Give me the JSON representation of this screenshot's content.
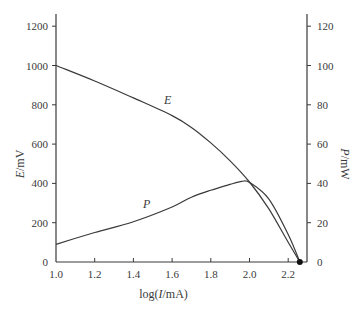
{
  "chart_data": {
    "type": "line",
    "title": "",
    "xlabel": "log(I/mA)",
    "ylabel_left": "E/mV",
    "ylabel_right": "P/mW",
    "xlim": [
      1.0,
      2.3
    ],
    "ylim_left": [
      0,
      1250
    ],
    "ylim_right": [
      0,
      125
    ],
    "x_ticks": [
      "1.0",
      "1.2",
      "1.4",
      "1.6",
      "1.8",
      "2.0",
      "2.2"
    ],
    "y_ticks_left": [
      "0",
      "200",
      "400",
      "600",
      "800",
      "1000",
      "1200"
    ],
    "y_ticks_right": [
      "0",
      "20",
      "40",
      "60",
      "80",
      "100",
      "120"
    ],
    "grid": false,
    "legend": "none (curves labeled inline)",
    "series": [
      {
        "name": "E",
        "axis": "left",
        "x": [
          1.0,
          1.2,
          1.4,
          1.6,
          1.7,
          1.8,
          1.9,
          2.0,
          2.1,
          2.2,
          2.26
        ],
        "values": [
          1000,
          921,
          835,
          745,
          685,
          606,
          515,
          407,
          270,
          100,
          0
        ]
      },
      {
        "name": "P",
        "axis": "right",
        "x": [
          1.0,
          1.2,
          1.4,
          1.6,
          1.7,
          1.8,
          1.9,
          1.96,
          2.0,
          2.1,
          2.2,
          2.26
        ],
        "values": [
          9,
          15,
          20.5,
          28,
          33,
          36.5,
          39.5,
          41,
          40.5,
          32,
          14,
          0
        ]
      }
    ],
    "annotations": [
      {
        "text": "E",
        "x": 1.58,
        "y_left": 830
      },
      {
        "text": "P",
        "x": 1.47,
        "y_left": 290
      },
      {
        "text": "end-point marker",
        "x": 2.26,
        "y_left": 0
      }
    ]
  }
}
